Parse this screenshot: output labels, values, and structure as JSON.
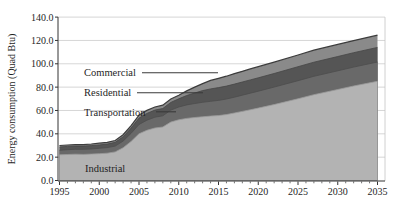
{
  "chart_data": {
    "type": "area",
    "stacked": true,
    "title": "",
    "xlabel": "",
    "ylabel": "Energy consumption (Quad Btu)",
    "xlim": [
      1995,
      2035
    ],
    "ylim": [
      0,
      140
    ],
    "grid": true,
    "legend_position": "in-plot annotated labels with leader lines",
    "x_ticks": [
      "1995",
      "2000",
      "2005",
      "2010",
      "2015",
      "2020",
      "2025",
      "2030",
      "2035"
    ],
    "y_ticks": [
      "0.0",
      "20.0",
      "40.0",
      "60.0",
      "80.0",
      "100.0",
      "120.0",
      "140.0"
    ],
    "x": [
      1995,
      1996,
      1997,
      1998,
      1999,
      2000,
      2001,
      2002,
      2003,
      2004,
      2005,
      2006,
      2007,
      2008,
      2009,
      2010,
      2011,
      2012,
      2013,
      2014,
      2015,
      2016,
      2017,
      2018,
      2019,
      2020,
      2022,
      2025,
      2027,
      2030,
      2032,
      2035
    ],
    "series": [
      {
        "name": "Industrial",
        "color": "#b3b3b3",
        "edge": "#9a9a9a",
        "values": [
          22.0,
          22.3,
          22.5,
          22.4,
          22.6,
          23.0,
          23.4,
          24.5,
          28.0,
          33.5,
          40.0,
          43.0,
          45.0,
          45.8,
          50.0,
          52.0,
          53.2,
          54.0,
          54.6,
          55.2,
          55.6,
          56.5,
          57.8,
          59.2,
          60.6,
          62.0,
          65.0,
          70.0,
          73.5,
          78.0,
          81.0,
          85.0
        ]
      },
      {
        "name": "Transportation",
        "color": "#696969",
        "edge": "#4c4c4c",
        "values": [
          4.0,
          4.1,
          4.2,
          4.3,
          4.4,
          4.6,
          4.8,
          5.0,
          5.8,
          6.9,
          8.0,
          8.7,
          9.2,
          9.6,
          10.3,
          11.0,
          11.6,
          12.0,
          12.4,
          12.7,
          13.0,
          13.3,
          13.6,
          13.9,
          14.2,
          14.5,
          15.0,
          15.5,
          15.8,
          16.0,
          16.2,
          16.5
        ]
      },
      {
        "name": "Residential",
        "color": "#555555",
        "edge": "#454545",
        "values": [
          2.8,
          2.8,
          2.8,
          2.8,
          2.9,
          2.9,
          3.0,
          3.2,
          3.6,
          4.5,
          5.5,
          5.8,
          6.1,
          6.3,
          6.6,
          7.0,
          8.0,
          9.0,
          10.0,
          10.6,
          11.0,
          11.1,
          11.2,
          11.3,
          11.4,
          11.5,
          11.7,
          12.0,
          12.1,
          12.2,
          12.3,
          12.5
        ]
      },
      {
        "name": "Commercial",
        "color": "#8a8a8a",
        "edge": "#3c3c3c",
        "values": [
          1.2,
          1.2,
          1.3,
          1.3,
          1.4,
          1.5,
          1.55,
          1.6,
          1.8,
          2.1,
          2.5,
          2.6,
          2.7,
          2.8,
          2.9,
          3.0,
          4.0,
          5.0,
          6.0,
          7.3,
          8.0,
          8.5,
          9.0,
          9.2,
          9.4,
          9.5,
          9.7,
          10.0,
          10.2,
          10.4,
          10.4,
          10.5
        ]
      }
    ],
    "colors": {
      "grid": "#cccccc",
      "axis": "#333333",
      "plot_right_border": "#c4c4c4",
      "leader_line": "#3a3a3a",
      "text": "#1f1f1f"
    }
  }
}
